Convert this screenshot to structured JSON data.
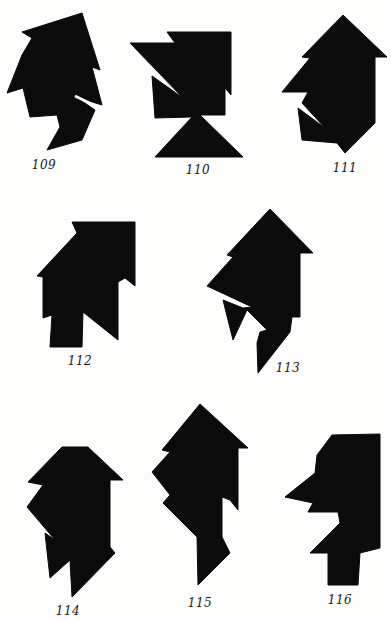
{
  "page": {
    "background": "#fdfdfc",
    "fill_color": "#0b0b0b",
    "gap_color": "#fdfdfc"
  },
  "figures": [
    {
      "label": "109",
      "label_x": 44,
      "label_y": 158,
      "points": "22,32 82,13 100,70 92,67 102,105 76,97 95,110 82,140 47,150 60,127 57,115 30,117 23,88 7,93 22,55 32,38",
      "gap": "75,96 100,108"
    },
    {
      "label": "110",
      "label_x": 198,
      "label_y": 163,
      "points": "130,43 175,43 167,32 231,32 231,95 225,88 225,115 200,115 243,157 155,157 192,117 155,118 152,76 183,98",
      "gap": ""
    },
    {
      "label": "111",
      "label_x": 345,
      "label_y": 161,
      "points": "343,15 387,57 375,57 375,123 345,153 337,143 302,140 298,108 325,128 302,103 308,92 282,92 310,58 302,57",
      "gap": ""
    },
    {
      "label": "112",
      "label_x": 80,
      "label_y": 354,
      "points": "72,222 135,222 135,286 125,278 118,282 118,340 83,312 82,347 50,347 52,315 43,318 43,277 37,276 77,233",
      "gap": ""
    },
    {
      "label": "113",
      "label_x": 288,
      "label_y": 361,
      "points": "270,209 313,253 300,253 300,317 292,317 290,332 258,373 257,343 260,332 267,330 247,310 233,340 223,300 243,308 252,307 207,286 233,257 227,255",
      "gap": ""
    },
    {
      "label": "114",
      "label_x": 68,
      "label_y": 604,
      "points": "62,447 88,447 123,480 110,480 110,547 115,553 72,597 70,560 50,578 45,533 55,540 27,507 43,485 28,482",
      "gap": ""
    },
    {
      "label": "115",
      "label_x": 200,
      "label_y": 596,
      "points": "200,404 248,448 238,448 238,510 230,500 222,497 222,537 230,553 198,585 197,537 163,503 170,495 152,472 170,452 162,450",
      "gap": ""
    },
    {
      "label": "116",
      "label_x": 340,
      "label_y": 593,
      "points": "332,435 380,434 380,548 360,553 358,585 328,585 328,553 310,553 340,523 338,512 308,512 313,503 285,497 315,473 317,455",
      "gap": ""
    }
  ]
}
